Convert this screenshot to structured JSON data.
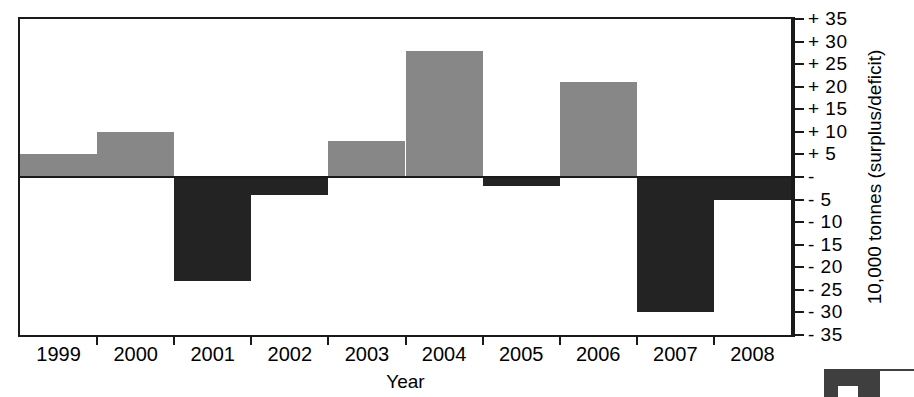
{
  "chart_data": {
    "type": "bar",
    "title": "",
    "subtitle": "",
    "xlabel": "Year",
    "ylabel": "10,000 tonnes (surplus/deficit)",
    "categories": [
      "1999",
      "2000",
      "2001",
      "2002",
      "2003",
      "2004",
      "2005",
      "2006",
      "2007",
      "2008"
    ],
    "values": [
      5,
      10,
      -23,
      -4,
      8,
      28,
      -2,
      21,
      -30,
      -5
    ],
    "series": [
      {
        "name": "surplus/deficit",
        "values": [
          5,
          10,
          -23,
          -4,
          8,
          28,
          -2,
          21,
          -30,
          -5
        ]
      }
    ],
    "ylim": [
      -35,
      35
    ],
    "ytick_values": [
      35,
      30,
      25,
      20,
      15,
      10,
      5,
      0,
      -5,
      -10,
      -15,
      -20,
      -25,
      -30,
      -35
    ],
    "ytick_labels": [
      "+ 35",
      "+ 30",
      "+ 25",
      "+ 20",
      "+ 15",
      "+ 10",
      "+ 5",
      "-",
      "- 5",
      "- 10",
      "- 15",
      "- 20",
      "- 25",
      "- 30",
      "- 35"
    ],
    "grid": false,
    "legend": "none",
    "y_axis_position": "right",
    "colors": {
      "positive_bar": "#878787",
      "negative_bar": "#232323",
      "axis": "#1a1a1a",
      "background": "#ffffff",
      "text": "#000000"
    }
  },
  "corner_mark": {
    "label": "partial-graphic"
  }
}
